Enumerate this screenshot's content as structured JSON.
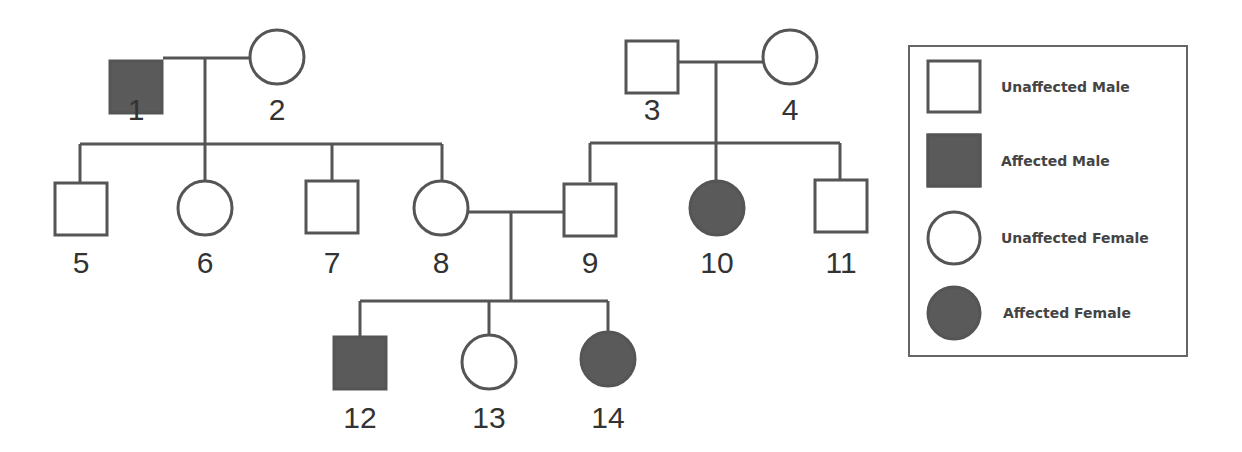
{
  "diagram": {
    "type": "pedigree",
    "colors": {
      "line": "#555555",
      "affected_fill": "#5a5a5a",
      "unaffected_fill": "#ffffff",
      "label": "#333333"
    },
    "individuals": [
      {
        "id": "1",
        "sex": "male",
        "affected": true,
        "x": 136,
        "y": 87
      },
      {
        "id": "2",
        "sex": "female",
        "affected": false,
        "x": 277,
        "y": 57
      },
      {
        "id": "3",
        "sex": "male",
        "affected": false,
        "x": 652,
        "y": 67
      },
      {
        "id": "4",
        "sex": "female",
        "affected": false,
        "x": 790,
        "y": 57
      },
      {
        "id": "5",
        "sex": "male",
        "affected": false,
        "x": 81,
        "y": 209
      },
      {
        "id": "6",
        "sex": "female",
        "affected": false,
        "x": 205,
        "y": 208
      },
      {
        "id": "7",
        "sex": "male",
        "affected": false,
        "x": 332,
        "y": 207
      },
      {
        "id": "8",
        "sex": "female",
        "affected": false,
        "x": 441,
        "y": 208
      },
      {
        "id": "9",
        "sex": "male",
        "affected": false,
        "x": 590,
        "y": 210
      },
      {
        "id": "10",
        "sex": "female",
        "affected": true,
        "x": 717,
        "y": 208
      },
      {
        "id": "11",
        "sex": "male",
        "affected": false,
        "x": 841,
        "y": 206
      },
      {
        "id": "12",
        "sex": "male",
        "affected": true,
        "x": 360,
        "y": 363
      },
      {
        "id": "13",
        "sex": "female",
        "affected": false,
        "x": 489,
        "y": 362
      },
      {
        "id": "14",
        "sex": "female",
        "affected": true,
        "x": 608,
        "y": 359
      }
    ],
    "labels": [
      {
        "text": "1",
        "x": 136,
        "y": 120
      },
      {
        "text": "2",
        "x": 277,
        "y": 120
      },
      {
        "text": "3",
        "x": 652,
        "y": 120
      },
      {
        "text": "4",
        "x": 790,
        "y": 120
      },
      {
        "text": "5",
        "x": 81,
        "y": 273
      },
      {
        "text": "6",
        "x": 205,
        "y": 273
      },
      {
        "text": "7",
        "x": 332,
        "y": 273
      },
      {
        "text": "8",
        "x": 441,
        "y": 273
      },
      {
        "text": "9",
        "x": 590,
        "y": 273
      },
      {
        "text": "10",
        "x": 717,
        "y": 273
      },
      {
        "text": "11",
        "x": 841,
        "y": 273
      },
      {
        "text": "12",
        "x": 360,
        "y": 428
      },
      {
        "text": "13",
        "x": 489,
        "y": 428
      },
      {
        "text": "14",
        "x": 608,
        "y": 428
      }
    ],
    "matings": [
      [
        "1",
        "2"
      ],
      [
        "3",
        "4"
      ],
      [
        "8",
        "9"
      ]
    ],
    "offspring": {
      "1x2": [
        "5",
        "6",
        "7",
        "8"
      ],
      "3x4": [
        "9",
        "10",
        "11"
      ],
      "8x9": [
        "12",
        "13",
        "14"
      ]
    }
  },
  "legend": {
    "items": [
      {
        "symbol": "square",
        "filled": false,
        "label": "Unaffected Male"
      },
      {
        "symbol": "square",
        "filled": true,
        "label": "Affected Male"
      },
      {
        "symbol": "circle",
        "filled": false,
        "label": "Unaffected Female"
      },
      {
        "symbol": "circle",
        "filled": true,
        "label": "Affected Female"
      }
    ]
  }
}
